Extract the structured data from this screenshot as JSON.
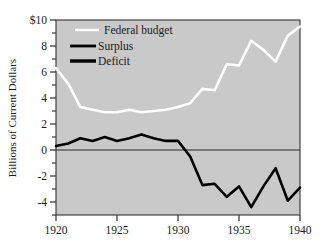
{
  "chart_data": {
    "type": "line",
    "title": "",
    "xlabel": "",
    "ylabel": "Billions of Current Dollars",
    "xlim": [
      1920,
      1940
    ],
    "ylim": [
      -5,
      10
    ],
    "xticks": [
      1920,
      1925,
      1930,
      1935,
      1940
    ],
    "xtick_labels": [
      "1920",
      "1925",
      "1930",
      "1935",
      "1940"
    ],
    "yticks": [
      -4,
      -2,
      0,
      2,
      4,
      6,
      8,
      10
    ],
    "ytick_labels": [
      "-4",
      "-2",
      "0",
      "2",
      "4",
      "6",
      "8",
      "$10"
    ],
    "minor_yticks": [
      -5,
      -3,
      -1,
      1,
      3,
      5,
      7,
      9
    ],
    "grid": false,
    "plot_background": "#c9c9c9",
    "legend_position": "upper-left-inside",
    "x": [
      1920,
      1921,
      1922,
      1923,
      1924,
      1925,
      1926,
      1927,
      1928,
      1929,
      1930,
      1931,
      1932,
      1933,
      1934,
      1935,
      1936,
      1937,
      1938,
      1939,
      1940
    ],
    "series": [
      {
        "name": "Federal budget",
        "color": "#ffffff",
        "linewidth": 2.6,
        "values": [
          6.3,
          5.1,
          3.3,
          3.1,
          2.9,
          2.9,
          3.1,
          2.9,
          3.0,
          3.1,
          3.3,
          3.6,
          4.7,
          4.6,
          6.6,
          6.5,
          8.4,
          7.7,
          6.8,
          8.8,
          9.5
        ]
      },
      {
        "name": "Surplus/Deficit",
        "color": "#000000",
        "linewidth": 2.6,
        "values": [
          0.3,
          0.5,
          0.9,
          0.7,
          1.0,
          0.7,
          0.9,
          1.2,
          0.9,
          0.7,
          0.7,
          -0.5,
          -2.7,
          -2.6,
          -3.6,
          -2.8,
          -4.4,
          -2.8,
          -1.4,
          -3.9,
          -2.9
        ]
      }
    ],
    "legend": [
      {
        "label": "Federal budget",
        "color": "#ffffff",
        "linewidth": 2.4
      },
      {
        "label": "Surplus",
        "color": "#000000",
        "linewidth": 2.8
      },
      {
        "label": "Deficit",
        "color": "#000000",
        "linewidth": 3.4
      }
    ],
    "zero_line": 0
  }
}
